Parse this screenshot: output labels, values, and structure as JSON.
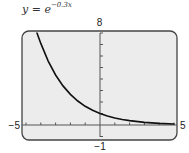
{
  "title": {
    "prefix": "y = e",
    "exponent": "−0.3x"
  },
  "colors": {
    "frame_fill": "#ececec",
    "frame_stroke": "#444444",
    "axis": "#555555",
    "curve": "#111111"
  },
  "chart_data": {
    "type": "line",
    "xlabel": "",
    "ylabel": "",
    "xlim": [
      -5,
      5
    ],
    "ylim": [
      -1,
      8
    ],
    "xticks": [
      -5,
      -4,
      -3,
      -2,
      -1,
      0,
      1,
      2,
      3,
      4,
      5
    ],
    "yticks": [
      -1,
      0,
      1,
      2,
      3,
      4,
      5,
      6,
      7,
      8
    ],
    "tick_labels": {
      "xmin": "−5",
      "xmax": "5",
      "ymin": "−1",
      "ymax": "8"
    },
    "grid": false,
    "series": [
      {
        "name": "y = e^(-0.3x)",
        "x": [
          -4.26,
          -4,
          -3.5,
          -3,
          -2.5,
          -2,
          -1.5,
          -1,
          -0.5,
          0,
          0.5,
          1,
          1.5,
          2,
          3,
          4,
          5
        ],
        "y": [
          8.0,
          7.1,
          5.56,
          4.35,
          3.4,
          2.66,
          2.09,
          1.63,
          1.28,
          1.0,
          0.78,
          0.61,
          0.48,
          0.38,
          0.23,
          0.14,
          0.09
        ]
      }
    ]
  }
}
